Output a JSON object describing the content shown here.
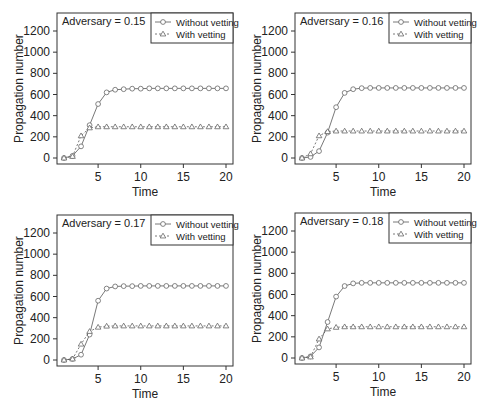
{
  "figure": {
    "panel_count": 4
  },
  "chart_data": [
    {
      "type": "line",
      "title": "Adversary = 0.15",
      "xlabel": "Time",
      "ylabel": "Propagation number",
      "xlim": [
        1,
        20
      ],
      "ylim": [
        0,
        1200
      ],
      "xticks": [
        5,
        10,
        15,
        20
      ],
      "yticks": [
        0,
        200,
        400,
        600,
        800,
        1000,
        1200
      ],
      "grid": false,
      "legend_position": "top-right",
      "x": [
        1,
        2,
        3,
        4,
        5,
        6,
        7,
        8,
        9,
        10,
        11,
        12,
        13,
        14,
        15,
        16,
        17,
        18,
        19,
        20
      ],
      "series": [
        {
          "name": "Without vetting",
          "marker": "circle",
          "line": "solid",
          "values": [
            0,
            20,
            110,
            310,
            510,
            620,
            645,
            650,
            655,
            655,
            658,
            658,
            658,
            658,
            658,
            658,
            658,
            658,
            658,
            658
          ]
        },
        {
          "name": "With vetting",
          "marker": "triangle",
          "line": "dashed",
          "values": [
            0,
            15,
            210,
            285,
            295,
            295,
            295,
            295,
            295,
            295,
            295,
            295,
            295,
            295,
            295,
            295,
            295,
            295,
            295,
            295
          ]
        }
      ]
    },
    {
      "type": "line",
      "title": "Adversary = 0.16",
      "xlabel": "Time",
      "ylabel": "Propagation number",
      "xlim": [
        1,
        20
      ],
      "ylim": [
        0,
        1200
      ],
      "xticks": [
        5,
        10,
        15,
        20
      ],
      "yticks": [
        0,
        200,
        400,
        600,
        800,
        1000,
        1200
      ],
      "grid": false,
      "legend_position": "top-right",
      "x": [
        1,
        2,
        3,
        4,
        5,
        6,
        7,
        8,
        9,
        10,
        11,
        12,
        13,
        14,
        15,
        16,
        17,
        18,
        19,
        20
      ],
      "series": [
        {
          "name": "Without vetting",
          "marker": "circle",
          "line": "solid",
          "values": [
            0,
            10,
            65,
            240,
            480,
            615,
            650,
            660,
            662,
            662,
            662,
            662,
            662,
            662,
            662,
            662,
            662,
            662,
            662,
            662
          ]
        },
        {
          "name": "With vetting",
          "marker": "triangle",
          "line": "dashed",
          "values": [
            0,
            40,
            210,
            250,
            255,
            255,
            255,
            255,
            255,
            255,
            255,
            255,
            255,
            255,
            255,
            255,
            255,
            255,
            255,
            255
          ]
        }
      ]
    },
    {
      "type": "line",
      "title": "Adversary = 0.17",
      "xlabel": "Time",
      "ylabel": "Propagation number",
      "xlim": [
        1,
        20
      ],
      "ylim": [
        0,
        1200
      ],
      "xticks": [
        5,
        10,
        15,
        20
      ],
      "yticks": [
        0,
        200,
        400,
        600,
        800,
        1000,
        1200
      ],
      "grid": false,
      "legend_position": "top-right",
      "x": [
        1,
        2,
        3,
        4,
        5,
        6,
        7,
        8,
        9,
        10,
        11,
        12,
        13,
        14,
        15,
        16,
        17,
        18,
        19,
        20
      ],
      "series": [
        {
          "name": "Without vetting",
          "marker": "circle",
          "line": "solid",
          "values": [
            0,
            10,
            50,
            240,
            560,
            675,
            695,
            698,
            698,
            700,
            700,
            700,
            700,
            700,
            700,
            700,
            700,
            700,
            700,
            700
          ]
        },
        {
          "name": "With vetting",
          "marker": "triangle",
          "line": "dashed",
          "values": [
            0,
            10,
            150,
            270,
            310,
            320,
            322,
            322,
            322,
            322,
            322,
            322,
            322,
            322,
            322,
            322,
            322,
            322,
            322,
            322
          ]
        }
      ]
    },
    {
      "type": "line",
      "title": "Adversary = 0.18",
      "xlabel": "Time",
      "ylabel": "Propagation number",
      "xlim": [
        1,
        20
      ],
      "ylim": [
        0,
        1200
      ],
      "xticks": [
        5,
        10,
        15,
        20
      ],
      "yticks": [
        0,
        200,
        400,
        600,
        800,
        1000,
        1200
      ],
      "grid": false,
      "legend_position": "top-right",
      "x": [
        1,
        2,
        3,
        4,
        5,
        6,
        7,
        8,
        9,
        10,
        11,
        12,
        13,
        14,
        15,
        16,
        17,
        18,
        19,
        20
      ],
      "series": [
        {
          "name": "Without vetting",
          "marker": "circle",
          "line": "solid",
          "values": [
            0,
            15,
            100,
            340,
            580,
            680,
            705,
            710,
            710,
            710,
            710,
            710,
            710,
            710,
            710,
            710,
            710,
            710,
            710,
            710
          ]
        },
        {
          "name": "With vetting",
          "marker": "triangle",
          "line": "dashed",
          "values": [
            0,
            10,
            180,
            275,
            290,
            295,
            295,
            295,
            295,
            295,
            295,
            295,
            295,
            295,
            295,
            295,
            295,
            295,
            295,
            295
          ]
        }
      ]
    }
  ],
  "style": {
    "line_color": "#555555",
    "marker_color": "#666666",
    "axis_color": "#333333",
    "text_color": "#222222"
  }
}
